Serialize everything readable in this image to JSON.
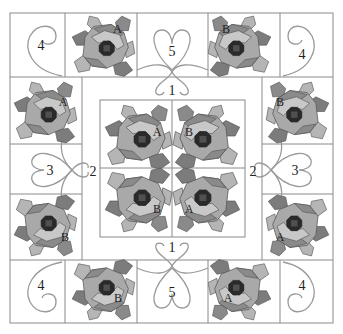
{
  "diagram": {
    "title": "",
    "colors": {
      "background": "#ffffff",
      "grid": "#8a8a8a",
      "quilting": "#9a9a9a",
      "petal_light": "#c8c8c8",
      "petal_mid": "#a9a9a9",
      "petal_dark": "#8a8a8a",
      "leaf": "#b5b5b5",
      "leaf_dark": "#7c7c7c",
      "center_dark": "#2a2a2a",
      "center_ring": "#505050"
    },
    "section_labels": [
      {
        "id": "corner-top-left",
        "text": "4"
      },
      {
        "id": "corner-top-right",
        "text": "4"
      },
      {
        "id": "corner-bottom-left",
        "text": "4"
      },
      {
        "id": "corner-bottom-right",
        "text": "4"
      },
      {
        "id": "heart-top",
        "text": "5"
      },
      {
        "id": "heart-bottom",
        "text": "5"
      },
      {
        "id": "side-left",
        "text": "3"
      },
      {
        "id": "side-right",
        "text": "3"
      },
      {
        "id": "sash-top",
        "text": "1"
      },
      {
        "id": "sash-bottom",
        "text": "1"
      },
      {
        "id": "sash-left",
        "text": "2"
      },
      {
        "id": "sash-right",
        "text": "2"
      }
    ],
    "rose_blocks": [
      {
        "id": "top-left-rose",
        "label": "A"
      },
      {
        "id": "top-right-rose",
        "label": "B"
      },
      {
        "id": "left-upper-rose",
        "label": "A"
      },
      {
        "id": "right-upper-rose",
        "label": "B"
      },
      {
        "id": "left-lower-rose",
        "label": "B"
      },
      {
        "id": "right-lower-rose",
        "label": "A"
      },
      {
        "id": "bottom-left-rose",
        "label": "B"
      },
      {
        "id": "bottom-right-rose",
        "label": "A"
      },
      {
        "id": "center-top-left-rose",
        "label": "A"
      },
      {
        "id": "center-top-right-rose",
        "label": "B"
      },
      {
        "id": "center-bottom-left-rose",
        "label": "B"
      },
      {
        "id": "center-bottom-right-rose",
        "label": "A"
      }
    ]
  }
}
